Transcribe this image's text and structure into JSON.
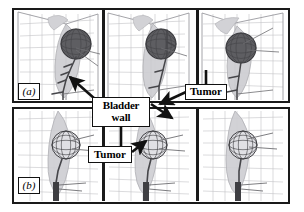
{
  "figure": {
    "caption_labels": {
      "panel_a": "(a)",
      "panel_b": "(b)"
    },
    "annotations": [
      {
        "id": "bladder-wall",
        "line1": "Bladder",
        "line2": "wall"
      },
      {
        "id": "tumor-top",
        "text": "Tumor"
      },
      {
        "id": "tumor-bottom",
        "text": "Tumor"
      }
    ],
    "colors": {
      "frame": "#1a1a1a",
      "grid": "#b9b9bd",
      "box_edge": "#8d8d93",
      "organ_fill": "#c9c9cc",
      "organ_edge": "#a3a3a8",
      "tumor_dark": "#5a5a5e",
      "tumor_light": "#dcdce0",
      "tumor_mesh": "#3c3c40",
      "instrument": "#4a4a4e",
      "arrow": "#111111",
      "background": "#ffffff"
    }
  },
  "rows": [
    {
      "name": "row-a",
      "label": "(a)",
      "panels": [
        {
          "name": "panel-a1",
          "tumor_shade": "dark",
          "tumor_cx": 62,
          "tumor_cy": 34,
          "tumor_r": 15
        },
        {
          "name": "panel-a2",
          "tumor_shade": "dark",
          "tumor_cx": 56,
          "tumor_cy": 34,
          "tumor_r": 15
        },
        {
          "name": "panel-a3",
          "tumor_shade": "dark",
          "tumor_cx": 42,
          "tumor_cy": 38,
          "tumor_r": 15
        }
      ]
    },
    {
      "name": "row-b",
      "label": "(b)",
      "panels": [
        {
          "name": "panel-b1",
          "tumor_shade": "light",
          "tumor_cx": 52,
          "tumor_cy": 36,
          "tumor_r": 14
        },
        {
          "name": "panel-b2",
          "tumor_shade": "light",
          "tumor_cx": 48,
          "tumor_cy": 36,
          "tumor_r": 14
        },
        {
          "name": "panel-b3",
          "tumor_shade": "light",
          "tumor_cx": 44,
          "tumor_cy": 36,
          "tumor_r": 14
        }
      ]
    }
  ]
}
